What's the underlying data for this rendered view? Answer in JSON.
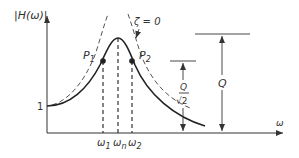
{
  "diagram": {
    "y_axis_label": "|H(ω)|",
    "x_axis_label": "ω",
    "baseline_label": "1",
    "damping_label": "ζ = 0",
    "points": [
      {
        "label": "P",
        "subscript": "1"
      },
      {
        "label": "P",
        "subscript": "2"
      }
    ],
    "frequency_labels": [
      {
        "label": "ω",
        "subscript": "1"
      },
      {
        "label": "ω",
        "subscript": "n"
      },
      {
        "label": "ω",
        "subscript": "2"
      }
    ],
    "dimension_half_power": {
      "numerator": "Q",
      "denominator": "√2"
    },
    "dimension_peak": {
      "label": "Q"
    },
    "colors": {
      "line": "#333333",
      "dashed": "#555555",
      "background": "#ffffff"
    }
  }
}
